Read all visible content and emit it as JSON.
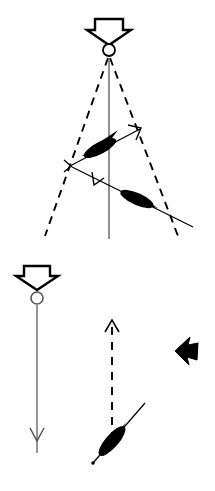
{
  "figure": {
    "width": 215,
    "height": 491,
    "background_color": "#ffffff",
    "stroke_color": "#000000",
    "fill_color": "#000000",
    "axis_line_color": "#6b6b6b",
    "title": "",
    "caption": ""
  },
  "panels": [
    {
      "id": "upper-panel",
      "name": "upper-panel",
      "label": "",
      "elements": [
        {
          "name": "down-block-arrow",
          "kind": "hollow-down-arrow",
          "x": 109,
          "y": 18,
          "width": 34,
          "height": 24,
          "filled": false
        },
        {
          "name": "source-circle",
          "kind": "circle",
          "cx": 109,
          "cy": 50,
          "r": 6,
          "filled": false
        },
        {
          "name": "vertical-axis-line",
          "kind": "line",
          "x1": 109,
          "y1": 57,
          "x2": 109,
          "y2": 238,
          "style": "solid",
          "color": "#6b6b6b"
        },
        {
          "name": "dashed-left-leg",
          "kind": "line",
          "x1": 109,
          "y1": 57,
          "x2": 45,
          "y2": 235,
          "style": "dashed",
          "color": "#000000"
        },
        {
          "name": "dashed-right-leg",
          "kind": "line",
          "x1": 109,
          "y1": 57,
          "x2": 177,
          "y2": 235,
          "style": "dashed",
          "color": "#000000"
        },
        {
          "name": "upper-vector-arrow",
          "kind": "arrow-line",
          "x1": 70,
          "y1": 166,
          "x2": 141,
          "y2": 128,
          "style": "solid",
          "arrowhead": "open-v-end"
        },
        {
          "name": "upper-lens-marker",
          "kind": "lens",
          "cx": 100,
          "cy": 148,
          "length": 34,
          "thickness": 12,
          "angle": -28,
          "filled": true
        },
        {
          "name": "lower-vector-arrow",
          "kind": "arrow-line",
          "x1": 70,
          "y1": 166,
          "x2": 192,
          "y2": 226,
          "style": "solid",
          "arrowhead": "open-v-mid"
        },
        {
          "name": "lower-lens-marker",
          "cx": 137,
          "cy": 199,
          "kind": "lens",
          "length": 34,
          "thickness": 12,
          "angle": 24,
          "filled": true
        },
        {
          "name": "left-vertex-point",
          "kind": "vertex",
          "x": 70,
          "y": 166
        }
      ]
    },
    {
      "id": "lower-panel",
      "name": "lower-panel",
      "label": "",
      "elements": [
        {
          "name": "down-block-arrow",
          "kind": "hollow-down-arrow",
          "x": 37,
          "y": 265,
          "width": 32,
          "height": 23,
          "filled": false
        },
        {
          "name": "source-circle",
          "kind": "circle",
          "cx": 37,
          "cy": 298,
          "r": 6,
          "filled": false
        },
        {
          "name": "vertical-down-arrow-line",
          "kind": "arrow-line",
          "x1": 37,
          "y1": 305,
          "x2": 37,
          "y2": 452,
          "style": "solid",
          "color": "#6b6b6b",
          "arrowhead": "open-v-near-end"
        },
        {
          "name": "dashed-up-arrow-line",
          "kind": "arrow-line",
          "x1": 112,
          "y1": 440,
          "x2": 112,
          "y2": 320,
          "style": "dashed",
          "color": "#000000",
          "arrowhead": "open-v-end"
        },
        {
          "name": "diagonal-line",
          "kind": "line",
          "x1": 93,
          "y1": 463,
          "x2": 144,
          "y2": 404,
          "style": "solid",
          "color": "#000000"
        },
        {
          "name": "diagonal-endpoint-dot",
          "kind": "dot",
          "cx": 93,
          "cy": 463,
          "r": 1.6,
          "filled": true
        },
        {
          "name": "diagonal-lens-marker",
          "kind": "lens",
          "cx": 112,
          "cy": 441,
          "length": 36,
          "thickness": 13,
          "angle": -49,
          "filled": true
        },
        {
          "name": "solid-left-arrow",
          "kind": "solid-left-arrow",
          "cx": 186,
          "cy": 351,
          "width": 24,
          "height": 28,
          "filled": true
        }
      ]
    }
  ],
  "colors": {
    "background": "#ffffff",
    "ink": "#000000",
    "axis_gray": "#6b6b6b"
  }
}
